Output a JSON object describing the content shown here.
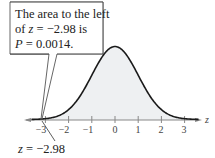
{
  "chart_data": {
    "type": "area",
    "title": "",
    "distribution": "standard normal",
    "xlabel": "z",
    "ylabel": "",
    "xlim": [
      -3.5,
      3.5
    ],
    "x_ticks": [
      -3,
      -2,
      -1,
      0,
      1,
      2,
      3
    ],
    "tick_labels": [
      "−3",
      "−2",
      "−1",
      "0",
      "1",
      "2",
      "3"
    ],
    "shaded_region": {
      "from": -3.5,
      "to": -2.98,
      "area": 0.0014
    },
    "marked_value": -2.98,
    "marker_label": "z = −2.98",
    "annotation": {
      "lines": [
        "The area to the left",
        "of z = −2.98 is",
        "P = 0.0014."
      ]
    },
    "grid": false,
    "legend": null
  },
  "callout": {
    "line1": "The area to the left",
    "line2_prefix": "of ",
    "line2_var": "z",
    "line2_rest": " = −2.98 is",
    "line3_var": "P",
    "line3_rest": " = 0.0014."
  },
  "axis": {
    "label": "z",
    "ticks": [
      "−3",
      "−2",
      "−1",
      "0",
      "1",
      "2",
      "3"
    ]
  },
  "marker": {
    "var": "z",
    "rest": " = −2.98"
  },
  "colors": {
    "curve": "#1a1a1a",
    "fill": "#eef0f2",
    "axis": "#888888",
    "callout_border": "#555555"
  }
}
